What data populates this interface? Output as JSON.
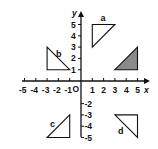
{
  "diagram": {
    "type": "coordinate-grid",
    "origin_label": "O",
    "x_axis_label": "x",
    "y_axis_label": "y",
    "x_ticks": [
      "-5",
      "-4",
      "-3",
      "-2",
      "-1",
      "1",
      "2",
      "3",
      "4",
      "5"
    ],
    "y_ticks": [
      "5",
      "4",
      "3",
      "2",
      "1",
      "-2",
      "-3",
      "-4",
      "-5"
    ],
    "range": {
      "x": [
        -5,
        5
      ],
      "y": [
        -5,
        5
      ]
    },
    "shapes": [
      {
        "name": "a",
        "label": "a",
        "vertices": [
          [
            1,
            5
          ],
          [
            3,
            5
          ],
          [
            1,
            3
          ]
        ],
        "shaded": false
      },
      {
        "name": "b",
        "label": "b",
        "vertices": [
          [
            -3,
            3
          ],
          [
            -3,
            1
          ],
          [
            -1,
            1
          ]
        ],
        "shaded": false
      },
      {
        "name": "shaded",
        "label": "",
        "vertices": [
          [
            3,
            1
          ],
          [
            5,
            1
          ],
          [
            5,
            3
          ]
        ],
        "shaded": true
      },
      {
        "name": "c",
        "label": "c",
        "vertices": [
          [
            -3,
            -5
          ],
          [
            -1,
            -5
          ],
          [
            -1,
            -3
          ]
        ],
        "shaded": false
      },
      {
        "name": "d",
        "label": "d",
        "vertices": [
          [
            3,
            -3
          ],
          [
            5,
            -3
          ],
          [
            5,
            -5
          ]
        ],
        "shaded": false
      }
    ],
    "colors": {
      "line": "#111111",
      "shade": "#8a8a8a",
      "background": "#ffffff"
    }
  }
}
